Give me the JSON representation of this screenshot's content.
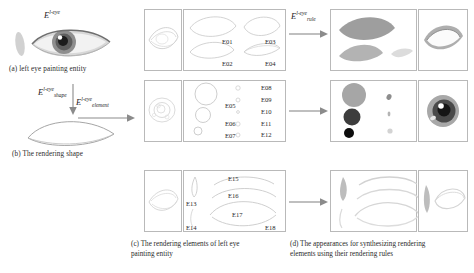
{
  "figure": {
    "title_note": "Left eye painting entity rendering decomposition figure",
    "captions": {
      "a": "(a) left eye painting entity",
      "b": "(b) The rendering shape",
      "c_line1": "(c)  The rendering elements of left eye",
      "c_line2": "painting entity",
      "d_line1": "(d)  The appearances for synthesizing rendering",
      "d_line2": "elements using their rendering rules"
    },
    "math_labels": {
      "entity": {
        "base": "E",
        "sup": "l-eye",
        "sub": ""
      },
      "shape": {
        "base": "E",
        "sup": "l-eye",
        "sub": "shape"
      },
      "element": {
        "base": "E",
        "sup": "l-eye",
        "sub": "element"
      },
      "rule": {
        "base": "E",
        "sup": "l-eye",
        "sub": "rule"
      }
    },
    "element_rows": [
      {
        "row_id": "row-shape",
        "labels_left": [
          "E01",
          "E02"
        ],
        "labels_right": [
          "E03",
          "E04"
        ]
      },
      {
        "row_id": "row-iris",
        "labels_left": [
          "E05",
          "E06",
          "E07"
        ],
        "labels_right": [
          "E08",
          "E09",
          "E10",
          "E11",
          "E12"
        ]
      },
      {
        "row_id": "row-lashes",
        "labels_left": [
          "E13",
          "E14"
        ],
        "labels_right": [
          "E15",
          "E16",
          "E17",
          "E18"
        ]
      }
    ],
    "colors": {
      "panel_border": "#b9b9b9",
      "stroke_light": "#cfcfcf",
      "arrow": "#8b8b8b",
      "fill_mid_gray": "#9a9a9a",
      "fill_dark_gray": "#3d3d3d",
      "fill_black": "#0d0d0d",
      "fill_pale": "#c9c9c9",
      "text": "#2a2a2a"
    }
  }
}
